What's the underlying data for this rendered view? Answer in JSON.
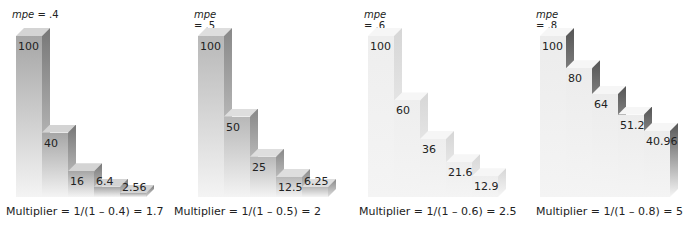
{
  "chart_data": [
    {
      "type": "bar",
      "title": "mpe = .4",
      "mpe": 0.4,
      "categories": [
        "1",
        "2",
        "3",
        "4",
        "5"
      ],
      "values": [
        100,
        40,
        16,
        6.4,
        2.56
      ],
      "caption": "Multiplier = 1/(1 – 0.4) = 1.7",
      "colors": {
        "front": "#a6a6a6",
        "top": "#d4d4d4",
        "side": "#777777"
      }
    },
    {
      "type": "bar",
      "title": "mpe = .5",
      "mpe": 0.5,
      "categories": [
        "1",
        "2",
        "3",
        "4",
        "5"
      ],
      "values": [
        100,
        50,
        25,
        12.5,
        6.25
      ],
      "caption": "Multiplier = 1/(1 – 0.5) = 2",
      "colors": {
        "front": "#b8b8b8",
        "top": "#dedede",
        "side": "#888888"
      }
    },
    {
      "type": "bar",
      "title": "mpe = .6",
      "mpe": 0.6,
      "categories": [
        "1",
        "2",
        "3",
        "4",
        "5"
      ],
      "values": [
        100,
        60,
        36,
        21.6,
        12.9
      ],
      "caption": "Multiplier = 1/(1 – 0.6) = 2.5",
      "colors": {
        "front": "#eeeeee",
        "top": "#f6f6f6",
        "side": "#d6d6d6"
      }
    },
    {
      "type": "bar",
      "title": "mpe = .8",
      "mpe": 0.8,
      "categories": [
        "1",
        "2",
        "3",
        "4",
        "5"
      ],
      "values": [
        100,
        80,
        64,
        51.2,
        40.96
      ],
      "caption": "Multiplier = 1/(1 – 0.8) = 5",
      "colors": {
        "front": "#ececec",
        "top": "#f6f6f6",
        "side": "#555555"
      }
    }
  ],
  "panels": [
    {
      "mpe_label": "mpe",
      "mpe_value": " = .4",
      "left": 4,
      "caption_left": 4,
      "labels": [
        "100",
        "40",
        "16",
        "6.4",
        "2.56"
      ]
    },
    {
      "mpe_label": "mpe",
      "mpe_value": " = .5",
      "left": 186,
      "caption_left": 172,
      "labels": [
        "100",
        "50",
        "25",
        "12.5",
        "6.25"
      ]
    },
    {
      "mpe_label": "mpe",
      "mpe_value": " = .6",
      "left": 356,
      "caption_left": 357,
      "labels": [
        "100",
        "60",
        "36",
        "21.6",
        "12.9"
      ]
    },
    {
      "mpe_label": "mpe",
      "mpe_value": " = .8",
      "left": 528,
      "caption_left": 534,
      "labels": [
        "100",
        "80",
        "64",
        "51.2",
        "40.96"
      ]
    }
  ]
}
